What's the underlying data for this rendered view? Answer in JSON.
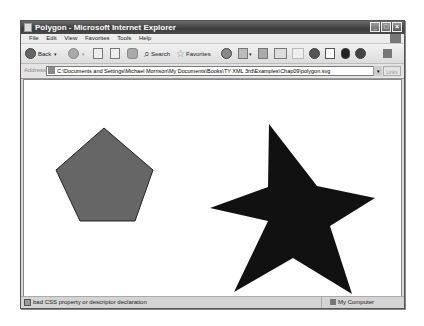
{
  "window": {
    "title": "Polygon - Microsoft Internet Explorer",
    "controls": {
      "minimize": "_",
      "maximize": "□",
      "close": "×"
    }
  },
  "menu": {
    "items": [
      {
        "label": "File"
      },
      {
        "label": "Edit"
      },
      {
        "label": "View"
      },
      {
        "label": "Favorites"
      },
      {
        "label": "Tools"
      },
      {
        "label": "Help"
      }
    ]
  },
  "toolbar": {
    "back_label": "Back",
    "search_label": "Search",
    "favorites_label": "Favorites",
    "icons": [
      "back-icon",
      "forward-icon",
      "stop-icon",
      "refresh-icon",
      "home-icon",
      "search-icon",
      "favorites-icon",
      "history-icon",
      "mail-icon",
      "print-icon",
      "edit-icon",
      "discuss-icon",
      "messenger-icon",
      "research-icon",
      "bluetooth-icon",
      "media-icon",
      "tools-icon"
    ]
  },
  "address": {
    "label": "Address",
    "value": "C:\\Documents and Settings\\Michael Morrison\\My Documents\\Books\\TY XML 3rd\\Examples\\Chap09\\polygon.svg",
    "links_label": "Links"
  },
  "content": {
    "pentagon": {
      "fill": "#666666",
      "stroke": "#222222",
      "points": "80,48 129,90 111,141 56,141 32,90"
    },
    "star": {
      "fill": "#111111",
      "points": "245,44 293,106 351,118 306,146 328,214 269,178 210,212 244,141 186,128 244,107"
    }
  },
  "status": {
    "message": "bad CSS property or descriptor declaration",
    "zone": "My Computer"
  }
}
